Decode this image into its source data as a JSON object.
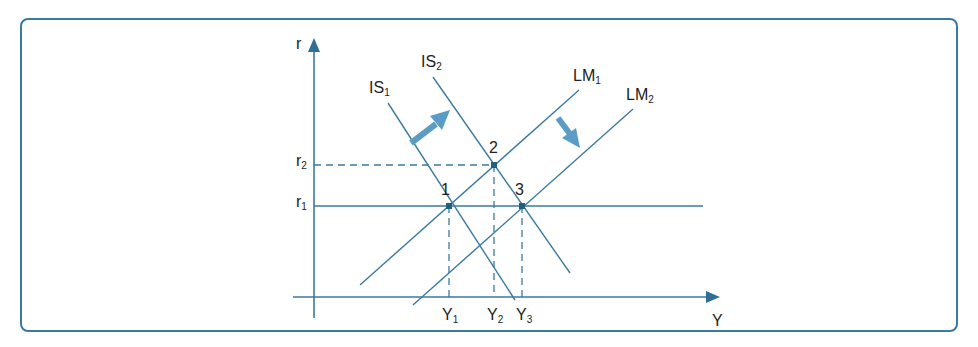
{
  "diagram": {
    "type": "IS-LM",
    "axes": {
      "x_label": "Y",
      "y_label": "r"
    },
    "curves": [
      {
        "id": "IS1",
        "label": "IS",
        "sub": "1"
      },
      {
        "id": "IS2",
        "label": "IS",
        "sub": "2"
      },
      {
        "id": "LM1",
        "label": "LM",
        "sub": "1"
      },
      {
        "id": "LM2",
        "label": "LM",
        "sub": "2"
      }
    ],
    "points": [
      {
        "label": "1",
        "rate": "r1",
        "output": "Y1"
      },
      {
        "label": "2",
        "rate": "r2",
        "output": "Y2"
      },
      {
        "label": "3",
        "rate": "r1",
        "output": "Y3"
      }
    ],
    "r_ticks": [
      {
        "label": "r",
        "sub": "1"
      },
      {
        "label": "r",
        "sub": "2"
      }
    ],
    "y_ticks": [
      {
        "label": "Y",
        "sub": "1"
      },
      {
        "label": "Y",
        "sub": "2"
      },
      {
        "label": "Y",
        "sub": "3"
      }
    ],
    "arrows": [
      "IS shifts right",
      "LM shifts right"
    ],
    "colors": {
      "line": "#3b7aa0",
      "arrow": "#5a9cc4",
      "frame": "#3b7aa0"
    }
  }
}
